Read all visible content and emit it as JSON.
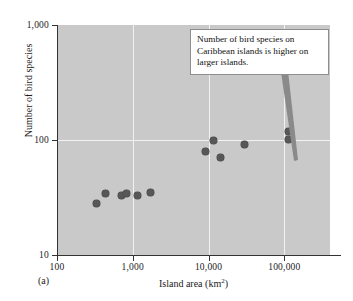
{
  "figure": {
    "panel_label": "(a)",
    "background_color": "#c9c9c9",
    "gridline_color": "#f2f2f2",
    "marker_color": "#575757"
  },
  "callout": {
    "text": "Number of bird species on Caribbean islands is higher on larger islands.",
    "border_color": "#8d8d8d",
    "background_color": "#ffffff"
  },
  "chart_data": {
    "type": "scatter",
    "title": "",
    "xlabel": "Island area (km",
    "xlabel_sup": "2",
    "xlabel_suffix": ")",
    "xlabel_full": "Island area (km2)",
    "ylabel": "Number of bird species",
    "xscale": "log",
    "yscale": "log",
    "xlim": [
      100,
      400000
    ],
    "ylim": [
      10,
      1000
    ],
    "grid": true,
    "legend": null,
    "xticks": [
      100,
      1000,
      10000,
      100000
    ],
    "xtick_labels": [
      "100",
      "1,000",
      "10,000",
      "100,000"
    ],
    "yticks": [
      10,
      100,
      1000
    ],
    "ytick_labels": [
      "10",
      "100",
      "1,000"
    ],
    "series": [
      {
        "name": "Caribbean islands",
        "marker": "circle",
        "color": "#575757",
        "points": [
          {
            "x": 330,
            "y": 28
          },
          {
            "x": 430,
            "y": 34
          },
          {
            "x": 700,
            "y": 33
          },
          {
            "x": 830,
            "y": 34
          },
          {
            "x": 1150,
            "y": 33
          },
          {
            "x": 1700,
            "y": 35
          },
          {
            "x": 9000,
            "y": 80
          },
          {
            "x": 11500,
            "y": 99
          },
          {
            "x": 14500,
            "y": 70
          },
          {
            "x": 30000,
            "y": 91
          },
          {
            "x": 113000,
            "y": 118
          },
          {
            "x": 113000,
            "y": 101
          }
        ]
      }
    ]
  }
}
